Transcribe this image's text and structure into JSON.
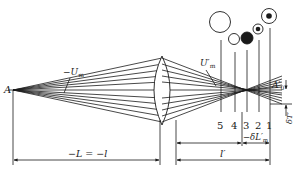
{
  "diagram": {
    "type": "optical-ray-diagram",
    "colors": {
      "ink": "#1a1a1a",
      "background": "#ffffff"
    },
    "labels": {
      "object_point": "A",
      "object_aperture_angle": "−U",
      "object_aperture_sub": "m",
      "image_aperture_angle": "U′",
      "image_aperture_sub": "m",
      "paraxial_image": "A′",
      "paraxial_image_sub": "0",
      "transverse_aberration": "δT′",
      "longitudinal_aberration": "−δL′",
      "longitudinal_aberration_sub": "m",
      "object_distance": "−L = −l",
      "image_distance": "l′"
    },
    "planes": [
      {
        "id": "5",
        "label": "5",
        "spot": "large-open-circle"
      },
      {
        "id": "4",
        "label": "4",
        "spot": "small-open-circle"
      },
      {
        "id": "3",
        "label": "3",
        "spot": "filled-circle"
      },
      {
        "id": "2",
        "label": "2",
        "spot": "ring-with-dot-small"
      },
      {
        "id": "1",
        "label": "1",
        "spot": "ring-with-dot"
      }
    ]
  }
}
